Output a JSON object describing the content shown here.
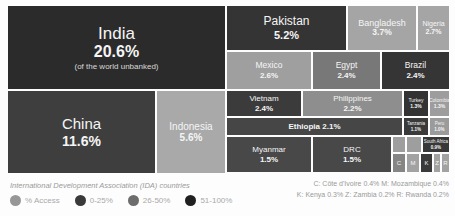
{
  "chart_data": {
    "type": "treemap",
    "unit": "% of the world unbanked",
    "blocks": [
      {
        "id": "india",
        "label": "India",
        "value": "20.6%",
        "value_pct": 20.6,
        "sub": "(of the world unbanked)",
        "color": "#2b2b2b",
        "x": 0,
        "y": 0,
        "w": 217,
        "h": 83,
        "fs": 17,
        "vfs": 16,
        "sfs": 8,
        "mode": "stack"
      },
      {
        "id": "china",
        "label": "China",
        "value": "11.6%",
        "value_pct": 11.6,
        "color": "#3e3e3e",
        "x": 0,
        "y": 85,
        "w": 147,
        "h": 82,
        "fs": 15,
        "vfs": 14,
        "mode": "stack"
      },
      {
        "id": "indonesia",
        "label": "Indonesia",
        "value": "5.6%",
        "value_pct": 5.6,
        "color": "#a9a9a9",
        "x": 149,
        "y": 85,
        "w": 68,
        "h": 82,
        "fs": 10,
        "vfs": 10,
        "mode": "stack"
      },
      {
        "id": "pakistan",
        "label": "Pakistan",
        "value": "5.2%",
        "value_pct": 5.2,
        "color": "#343434",
        "x": 219,
        "y": 0,
        "w": 119,
        "h": 44,
        "fs": 12,
        "vfs": 11,
        "mode": "stack"
      },
      {
        "id": "bangladesh",
        "label": "Bangladesh",
        "value": "3.7%",
        "value_pct": 3.7,
        "color": "#a5a5a5",
        "x": 340,
        "y": 0,
        "w": 68,
        "h": 44,
        "fs": 9,
        "vfs": 8.5,
        "mode": "stack"
      },
      {
        "id": "nigeria",
        "label": "Nigeria",
        "value": "2.7%",
        "value_pct": 2.7,
        "color": "#a5a5a5",
        "x": 410,
        "y": 0,
        "w": 31,
        "h": 44,
        "fs": 7,
        "vfs": 7,
        "mode": "stack"
      },
      {
        "id": "mexico",
        "label": "Mexico",
        "value": "2.6%",
        "value_pct": 2.6,
        "color": "#9f9f9f",
        "x": 219,
        "y": 46,
        "w": 84,
        "h": 37,
        "fs": 8.5,
        "vfs": 8,
        "mode": "stack"
      },
      {
        "id": "egypt",
        "label": "Egypt",
        "value": "2.4%",
        "value_pct": 2.4,
        "color": "#787878",
        "x": 305,
        "y": 46,
        "w": 67,
        "h": 37,
        "fs": 8.5,
        "vfs": 8,
        "mode": "stack"
      },
      {
        "id": "brazil",
        "label": "Brazil",
        "value": "2.4%",
        "value_pct": 2.4,
        "color": "#353535",
        "x": 374,
        "y": 46,
        "w": 67,
        "h": 37,
        "fs": 8.5,
        "vfs": 8,
        "mode": "stack"
      },
      {
        "id": "vietnam",
        "label": "Vietnam",
        "value": "2.4%",
        "value_pct": 2.4,
        "color": "#3b3b3b",
        "x": 219,
        "y": 85,
        "w": 74,
        "h": 25,
        "fs": 8,
        "vfs": 8,
        "mode": "stack"
      },
      {
        "id": "philippines",
        "label": "Philippines",
        "value": "2.2%",
        "value_pct": 2.2,
        "color": "#8e8e8e",
        "x": 295,
        "y": 85,
        "w": 99,
        "h": 25,
        "fs": 8,
        "vfs": 8,
        "mode": "stack"
      },
      {
        "id": "turkey",
        "label": "Turkey",
        "value": "1.3%",
        "value_pct": 1.3,
        "color": "#333333",
        "x": 396,
        "y": 85,
        "w": 24,
        "h": 25,
        "fs": 5,
        "vfs": 5,
        "mode": "stack"
      },
      {
        "id": "colombia",
        "label": "Colombia",
        "value": "1.3%",
        "value_pct": 1.3,
        "color": "#9d9d9d",
        "x": 422,
        "y": 85,
        "w": 19,
        "h": 25,
        "fs": 5,
        "vfs": 5,
        "mode": "stack"
      },
      {
        "id": "ethiopia",
        "label": "Ethiopia",
        "value": "2.1%",
        "value_pct": 2.1,
        "color": "#464646",
        "x": 219,
        "y": 112,
        "w": 175,
        "h": 17,
        "fs": 8,
        "mode": "inline"
      },
      {
        "id": "tanzania",
        "label": "Tanzania",
        "value": "1.1%",
        "value_pct": 1.1,
        "color": "#3a3a3a",
        "x": 396,
        "y": 112,
        "w": 24,
        "h": 17,
        "fs": 4.5,
        "vfs": 4.5,
        "mode": "stack"
      },
      {
        "id": "peru",
        "label": "Peru",
        "value": "1.0%",
        "value_pct": 1.0,
        "color": "#9b9b9b",
        "x": 422,
        "y": 112,
        "w": 19,
        "h": 17,
        "fs": 4.5,
        "vfs": 4.5,
        "mode": "stack"
      },
      {
        "id": "myanmar",
        "label": "Myanmar",
        "value": "1.5%",
        "value_pct": 1.5,
        "color": "#484848",
        "x": 219,
        "y": 131,
        "w": 84,
        "h": 35,
        "fs": 8,
        "vfs": 8,
        "mode": "stack"
      },
      {
        "id": "drc",
        "label": "DRC",
        "value": "1.5%",
        "value_pct": 1.5,
        "color": "#484848",
        "x": 305,
        "y": 131,
        "w": 78,
        "h": 35,
        "fs": 8,
        "vfs": 8,
        "mode": "stack"
      },
      {
        "id": "unlabeled-tile-1",
        "label": "",
        "value": "",
        "color": "#9e9e9e",
        "x": 385,
        "y": 131,
        "w": 12,
        "h": 15,
        "mode": "blank"
      },
      {
        "id": "unlabeled-tile-2",
        "label": "",
        "value": "",
        "color": "#9e9e9e",
        "x": 399,
        "y": 131,
        "w": 14,
        "h": 15,
        "mode": "blank"
      },
      {
        "id": "south-africa",
        "label": "South Africa",
        "value": "0.9%",
        "value_pct": 0.9,
        "color": "#383838",
        "x": 415,
        "y": 131,
        "w": 26,
        "h": 15,
        "fs": 4.5,
        "vfs": 4.5,
        "mode": "stack"
      },
      {
        "id": "cote-divoire",
        "label": "C",
        "value": "0.4%",
        "value_pct": 0.4,
        "color": "#858585",
        "x": 385,
        "y": 148,
        "w": 12,
        "h": 18,
        "fs": 6,
        "mode": "letter"
      },
      {
        "id": "mozambique",
        "label": "M",
        "value": "0.4%",
        "value_pct": 0.4,
        "color": "#a2a2a2",
        "x": 399,
        "y": 148,
        "w": 12,
        "h": 18,
        "fs": 6,
        "mode": "letter"
      },
      {
        "id": "kenya",
        "label": "K",
        "value": "0.3%",
        "value_pct": 0.3,
        "color": "#3a3a3a",
        "x": 413,
        "y": 148,
        "w": 11,
        "h": 18,
        "fs": 6,
        "mode": "letter"
      },
      {
        "id": "zambia",
        "label": "Z",
        "value": "0.2%",
        "value_pct": 0.2,
        "color": "#a2a2a2",
        "x": 426,
        "y": 148,
        "w": 6,
        "h": 18,
        "fs": 6,
        "mode": "letter"
      },
      {
        "id": "rwanda",
        "label": "R",
        "value": "0.2%",
        "value_pct": 0.2,
        "color": "#a2a2a2",
        "x": 434,
        "y": 148,
        "w": 7,
        "h": 18,
        "fs": 6,
        "mode": "letter"
      }
    ],
    "legend": {
      "items": [
        {
          "label": "% Access",
          "color": "#979797"
        },
        {
          "label": "0-25%",
          "color": "#3a3a3a"
        },
        {
          "label": "26-50%",
          "color": "#6d6d6d"
        },
        {
          "label": "51-100%",
          "color": "#202020"
        }
      ],
      "position": "bottom-left"
    }
  },
  "footer": {
    "ida_note": "International Development Association (IDA) countries",
    "footnotes": [
      "C: Côte d'Ivoire 0.4%  M: Mozambique 0.4%",
      "K: Kenya 0.3%  Z: Zambia 0.2%  R: Rwanda 0.2%"
    ]
  }
}
